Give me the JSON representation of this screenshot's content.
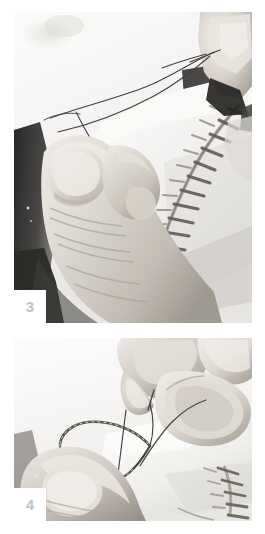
{
  "page": {
    "background_color": "#ffffff",
    "width": 265,
    "height": 534,
    "kind": "instructional-photo-sequence"
  },
  "panels": [
    {
      "id": "panel-3",
      "step_number": "3",
      "caption_text": "",
      "description": "Close-up grayscale photograph: a left thumb and fingers hold a pale fabric edge while a right hand fingertip at upper right pulls a dark thread; a curved row of stitches runs down the right side of the fabric.",
      "frame": {
        "x": 14,
        "y": 12,
        "width": 238,
        "height": 311
      },
      "badge_color": "#c2c2c2",
      "badge_background": "#ffffff",
      "photo_tone": "grayscale",
      "elements": [
        "thread-strand",
        "needle-tip",
        "thumb",
        "fingernail",
        "fabric-edge",
        "stitch-row"
      ]
    },
    {
      "id": "panel-4",
      "step_number": "4",
      "caption_text": "",
      "description": "Close-up grayscale photograph: two fingers at top pinch the needle and thread while a thumb below holds the fabric; a twisted loop of thread is wrapped around the needle forming a knot.",
      "frame": {
        "x": 14,
        "y": 338,
        "width": 238,
        "height": 183
      },
      "badge_color": "#c2c2c2",
      "badge_background": "#ffffff",
      "photo_tone": "grayscale",
      "elements": [
        "thread-loop",
        "twisted-thread",
        "needle-tip",
        "fingertip",
        "thumb",
        "fabric-edge",
        "stitch-row"
      ]
    }
  ],
  "colors": {
    "page_background": "#ffffff",
    "photo_light": "#f6f6f5",
    "photo_midtone": "#b9b7b4",
    "photo_shadow": "#2b2b2b",
    "skin_light": "#e2ded8",
    "skin_mid": "#c3bdb5",
    "skin_dark": "#8d8880",
    "thread_dark": "#3a3a3a",
    "badge_text": "#c2c2c2"
  }
}
